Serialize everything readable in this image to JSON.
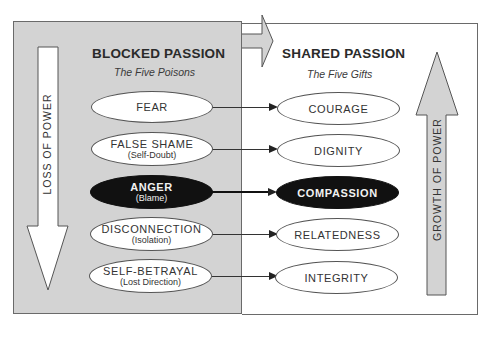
{
  "left_panel": {
    "heading": "BLOCKED PASSION",
    "subheading": "The Five Poisons",
    "arrow_label": "LOSS OF POWER",
    "background_color": "#d3d3d3",
    "items": [
      {
        "label": "FEAR",
        "sub": ""
      },
      {
        "label": "FALSE SHAME",
        "sub": "(Self-Doubt)"
      },
      {
        "label": "ANGER",
        "sub": "(Blame)",
        "highlighted": true
      },
      {
        "label": "DISCONNECTION",
        "sub": "(Isolation)"
      },
      {
        "label": "SELF-BETRAYAL",
        "sub": "(Lost Direction)"
      }
    ]
  },
  "right_panel": {
    "heading": "SHARED PASSION",
    "subheading": "The Five Gifts",
    "arrow_label": "GROWTH OF POWER",
    "background_color": "#ffffff",
    "items": [
      {
        "label": "COURAGE"
      },
      {
        "label": "DIGNITY"
      },
      {
        "label": "COMPASSION",
        "highlighted": true
      },
      {
        "label": "RELATEDNESS"
      },
      {
        "label": "INTEGRITY"
      }
    ]
  },
  "colors": {
    "highlight_fill": "#111111",
    "arrow_fill_gray": "#d3d3d3",
    "line": "#333333"
  }
}
